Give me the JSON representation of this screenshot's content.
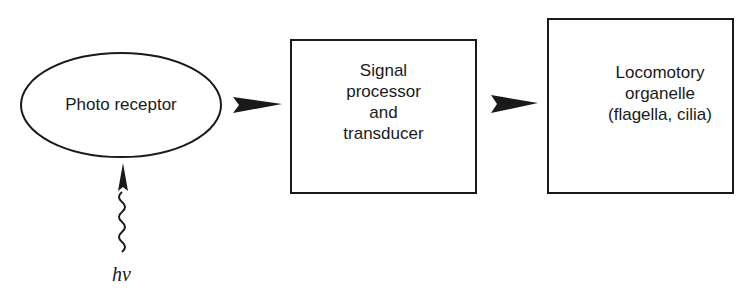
{
  "diagram": {
    "type": "block-flow",
    "nodes": [
      {
        "id": "photoreceptor",
        "shape": "ellipse",
        "label": "Photo receptor"
      },
      {
        "id": "signal-processor",
        "shape": "box",
        "label_lines": [
          "Signal",
          "processor",
          "and",
          "transducer"
        ]
      },
      {
        "id": "locomotory-organelle",
        "shape": "box",
        "label_lines": [
          "Locomotory",
          "organelle",
          "(flagella, cilia)"
        ]
      }
    ],
    "edges": [
      {
        "from": "photoreceptor",
        "to": "signal-processor",
        "style": "arrowhead"
      },
      {
        "from": "signal-processor",
        "to": "locomotory-organelle",
        "style": "arrowhead"
      },
      {
        "from": "light-input",
        "to": "photoreceptor",
        "style": "wavy-arrow"
      }
    ],
    "input": {
      "label": "hν",
      "meaning": "light photon"
    },
    "colors": {
      "stroke": "#1a1a1a",
      "background": "#ffffff"
    }
  }
}
